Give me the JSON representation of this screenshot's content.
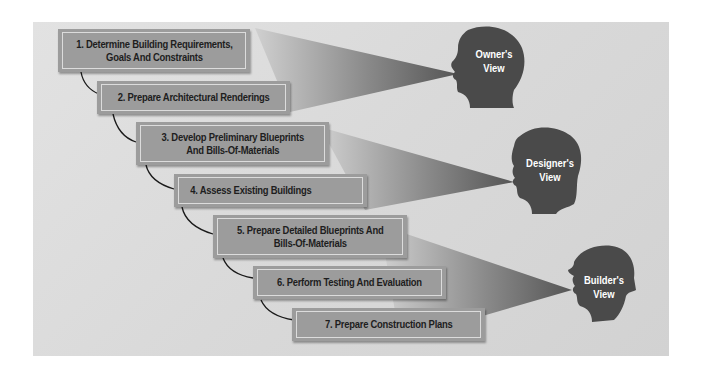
{
  "diagram": {
    "title": "",
    "steps": [
      {
        "number": 1,
        "line1": "1. Determine Building Requirements,",
        "line2": "Goals And Constraints"
      },
      {
        "number": 2,
        "line1": "2. Prepare Architectural Renderings",
        "line2": ""
      },
      {
        "number": 3,
        "line1": "3. Develop Preliminary Blueprints",
        "line2": "And Bills-Of-Materials"
      },
      {
        "number": 4,
        "line1": "4. Assess Existing Buildings",
        "line2": ""
      },
      {
        "number": 5,
        "line1": "5. Prepare Detailed Blueprints And",
        "line2": "Bills-Of-Materials"
      },
      {
        "number": 6,
        "line1": "6. Perform Testing And Evaluation",
        "line2": ""
      },
      {
        "number": 7,
        "line1": "7. Prepare Construction Plans",
        "line2": ""
      }
    ],
    "views": [
      {
        "id": "owner",
        "line1": "Owner's",
        "line2": "View",
        "icon": "owner-head-icon",
        "covers_steps": [
          1,
          2
        ]
      },
      {
        "id": "designer",
        "line1": "Designer's",
        "line2": "View",
        "icon": "designer-head-icon",
        "covers_steps": [
          3,
          4
        ]
      },
      {
        "id": "builder",
        "line1": "Builder's",
        "line2": "View",
        "icon": "builder-hardhat-head-icon",
        "covers_steps": [
          5,
          6,
          7
        ]
      }
    ],
    "colors": {
      "background": "#d9d9d9",
      "box_fill": "#9c9c9c",
      "box_inner_border": "#dcdcdc",
      "head_fill": "#4a4a4a",
      "cone_dark": "#5a5a5a",
      "cone_light": "#cfcfcf",
      "text_dark": "#1e1e1e",
      "text_light": "#ffffff"
    }
  }
}
